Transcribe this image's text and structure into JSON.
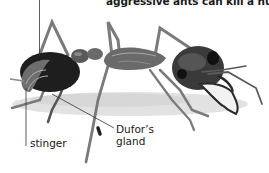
{
  "figure": {
    "caption_fragment": "aggressive ants can kill a human.",
    "labels": [
      {
        "id": "stinger",
        "text": "stinger"
      },
      {
        "id": "dufors-gland",
        "line1": "Dufor’s",
        "line2": "gland"
      }
    ],
    "colors": {
      "body_dark": "#1e1e1e",
      "body_mid": "#5a5a5a",
      "body_light": "#9a9a9a",
      "shadow": "#d4d4d4",
      "leader_line": "#333333",
      "text": "#1a1a1a"
    }
  }
}
